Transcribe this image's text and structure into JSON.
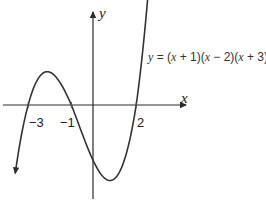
{
  "chart_data": {
    "type": "line",
    "title": "",
    "xlabel": "x",
    "ylabel": "y",
    "equation_label": "y = (x + 1)(x − 2)(x + 3)",
    "equation_parts": {
      "y": "y",
      "eq": " = (",
      "x1": "x",
      "p1": " + 1)(",
      "x2": "x",
      "p2": " − 2)(",
      "x3": "x",
      "p3": " + 3)"
    },
    "roots": [
      -3,
      -1,
      2
    ],
    "x_tick_labels": [
      "−3",
      "−1",
      "2"
    ],
    "function": "(x+1)(x-2)(x+3)",
    "x_range": [
      -3.6,
      2.55
    ],
    "grid": false,
    "legend": "none",
    "series": [
      {
        "name": "y = (x + 1)(x - 2)(x + 3)",
        "x": [
          -3.6,
          -3.5,
          -3.0,
          -2.5,
          -2.12,
          -2.0,
          -1.5,
          -1.0,
          -0.5,
          0.0,
          0.5,
          0.79,
          1.0,
          1.5,
          2.0,
          2.5
        ],
        "y": [
          -7.06,
          -5.63,
          0,
          3.38,
          4.06,
          4.0,
          2.63,
          0,
          -3.38,
          -6,
          -7.88,
          -8.21,
          -8.0,
          -5.63,
          0,
          7.88
        ]
      }
    ]
  }
}
